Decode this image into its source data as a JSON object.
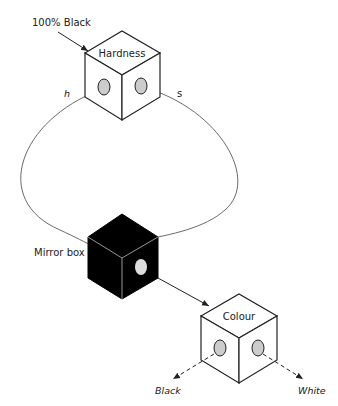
{
  "diagram": {
    "labels": {
      "input": "100% Black",
      "hardness": "Hardness",
      "h": "h",
      "s": "s",
      "mirror": "Mirror box",
      "colour": "Colour",
      "black": "Black",
      "white": "White"
    },
    "colors": {
      "stroke": "#222222",
      "port_fill": "#cccccc",
      "mirror_fill": "#000000",
      "box_fill": "#ffffff"
    }
  }
}
